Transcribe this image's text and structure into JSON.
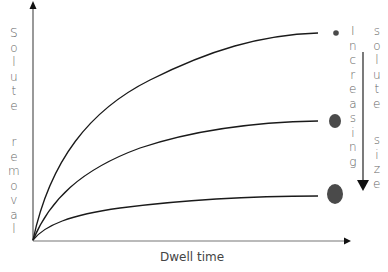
{
  "diagram": {
    "y_axis_label": "Solute removal",
    "x_axis_label": "Dwell time",
    "annotation_col1": "Increasing",
    "annotation_col2": "solute size",
    "curves": [
      {
        "name": "small-solute",
        "end_level": "high",
        "marker": "small-circle"
      },
      {
        "name": "medium-solute",
        "end_level": "medium",
        "marker": "medium-circle"
      },
      {
        "name": "large-solute",
        "end_level": "low",
        "marker": "large-circle"
      }
    ],
    "colors": {
      "axis": "#333333",
      "curve": "#1a1a1a",
      "marker": "#4a4a4a",
      "text": "#666666"
    }
  }
}
